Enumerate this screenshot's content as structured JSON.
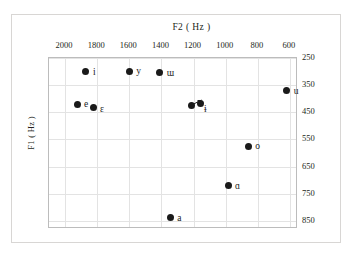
{
  "chart_data": {
    "type": "scatter",
    "title": "",
    "xlabel": "F2 ( Hz )",
    "ylabel": "F1 ( Hz )",
    "xlim": [
      2100,
      550
    ],
    "ylim": [
      250,
      880
    ],
    "x_reversed": true,
    "y_reversed": true,
    "grid": true,
    "legend": "none",
    "xticks": [
      2000,
      1800,
      1600,
      1400,
      1200,
      1000,
      800,
      600
    ],
    "xtick_labels": [
      "2000",
      "1800",
      "1600",
      "1400",
      "1200",
      "1000",
      "800",
      "600"
    ],
    "yticks": [
      250,
      350,
      450,
      550,
      650,
      750,
      850
    ],
    "ytick_labels": [
      "250",
      "350",
      "450",
      "550",
      "650",
      "750",
      "850"
    ],
    "ytick_side": "right",
    "xtick_side": "top",
    "point_color": "#1a1a1a",
    "points": [
      {
        "label": "i",
        "f2": 1870,
        "f1": 300,
        "label_dx": 7,
        "label_dy": -5
      },
      {
        "label": "y",
        "f2": 1600,
        "f1": 300,
        "label_dx": 7,
        "label_dy": -6
      },
      {
        "label": "ɯ",
        "f2": 1410,
        "f1": 305,
        "label_dx": 7,
        "label_dy": -5
      },
      {
        "label": "u",
        "f2": 620,
        "f1": 370,
        "label_dx": 7,
        "label_dy": -5
      },
      {
        "label": "e",
        "f2": 1920,
        "f1": 420,
        "label_dx": 6,
        "label_dy": -5
      },
      {
        "label": "ɛ",
        "f2": 1820,
        "f1": 432,
        "label_dx": 6,
        "label_dy": -3
      },
      {
        "label": "ɨ",
        "f2": 1160,
        "f1": 418,
        "label_dx": 4,
        "label_dy": 0
      },
      {
        "label": "",
        "f2": 1215,
        "f1": 425,
        "label_dx": 0,
        "label_dy": 0
      },
      {
        "label": "o",
        "f2": 860,
        "f1": 575,
        "label_dx": 7,
        "label_dy": -5
      },
      {
        "label": "ɑ",
        "f2": 985,
        "f1": 720,
        "label_dx": 7,
        "label_dy": -5
      },
      {
        "label": "a",
        "f2": 1345,
        "f1": 838,
        "label_dx": 7,
        "label_dy": -5
      }
    ],
    "annotations": [
      {
        "type": "arrow",
        "from_f2": 1215,
        "from_f1": 425,
        "to_f2": 1150,
        "to_f1": 405
      }
    ]
  }
}
